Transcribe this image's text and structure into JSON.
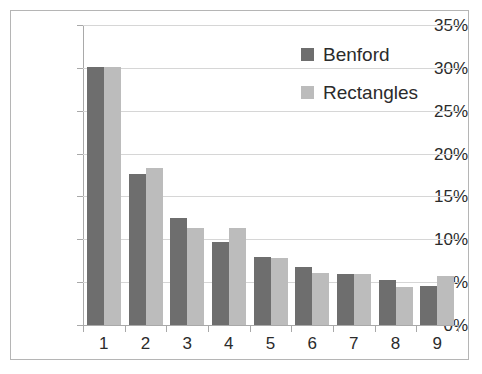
{
  "chart_data": {
    "type": "bar",
    "title": "",
    "subtitle": "",
    "xlabel": "",
    "ylabel": "",
    "categories": [
      "1",
      "2",
      "3",
      "4",
      "5",
      "6",
      "7",
      "8",
      "9"
    ],
    "series": [
      {
        "name": "Benford",
        "color": "#6e6e6e",
        "values": [
          30.1,
          17.6,
          12.5,
          9.7,
          7.9,
          6.8,
          6.0,
          5.2,
          4.6
        ]
      },
      {
        "name": "Rectangles",
        "color": "#bcbcbc",
        "values": [
          30.1,
          18.3,
          11.3,
          11.3,
          7.8,
          6.1,
          5.9,
          4.4,
          5.7
        ]
      }
    ],
    "ylim": [
      0,
      35
    ],
    "ytick_values": [
      0,
      5,
      10,
      15,
      20,
      25,
      30,
      35
    ],
    "ytick_labels": [
      "0%",
      "5%",
      "10%",
      "15%",
      "20%",
      "25%",
      "30%",
      "35%"
    ],
    "grid": true,
    "grid_axis": "y",
    "legend_position": "top-right",
    "value_unit": "percent",
    "frame_border_color": "#b5b5b5",
    "gridline_color": "#d6d6d6",
    "axis_color": "#a9a9a9",
    "background_color": "#ffffff"
  }
}
